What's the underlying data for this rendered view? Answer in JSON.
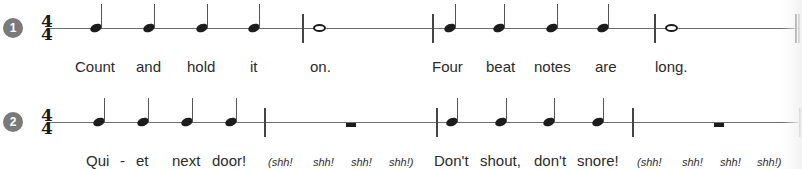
{
  "exercises": [
    {
      "number": "1",
      "time_signature": {
        "top": "4",
        "bottom": "4"
      },
      "measures": [
        {
          "notes": [
            "quarter",
            "quarter",
            "quarter",
            "quarter"
          ]
        },
        {
          "notes": [
            "whole"
          ]
        },
        {
          "notes": [
            "quarter",
            "quarter",
            "quarter",
            "quarter"
          ]
        },
        {
          "notes": [
            "whole"
          ]
        }
      ],
      "end_bar": "double",
      "lyrics": [
        "Count",
        "and",
        "hold",
        "it",
        "on.",
        "Four",
        "beat",
        "notes",
        "are",
        "long."
      ]
    },
    {
      "number": "2",
      "time_signature": {
        "top": "4",
        "bottom": "4"
      },
      "measures": [
        {
          "notes": [
            "quarter",
            "quarter",
            "quarter",
            "quarter"
          ]
        },
        {
          "notes": [
            "half-rest"
          ]
        },
        {
          "notes": [
            "quarter",
            "quarter",
            "quarter",
            "quarter"
          ]
        },
        {
          "notes": [
            "half-rest"
          ]
        }
      ],
      "end_bar": "single",
      "lyrics": [
        "Qui",
        "-",
        "et",
        "next",
        "door!",
        "(shh!",
        "shh!",
        "shh!",
        "shh!)",
        "Don't",
        "shout,",
        "don't",
        "snore!",
        "(shh!",
        "shh!",
        "shh!",
        "shh!)"
      ]
    }
  ]
}
